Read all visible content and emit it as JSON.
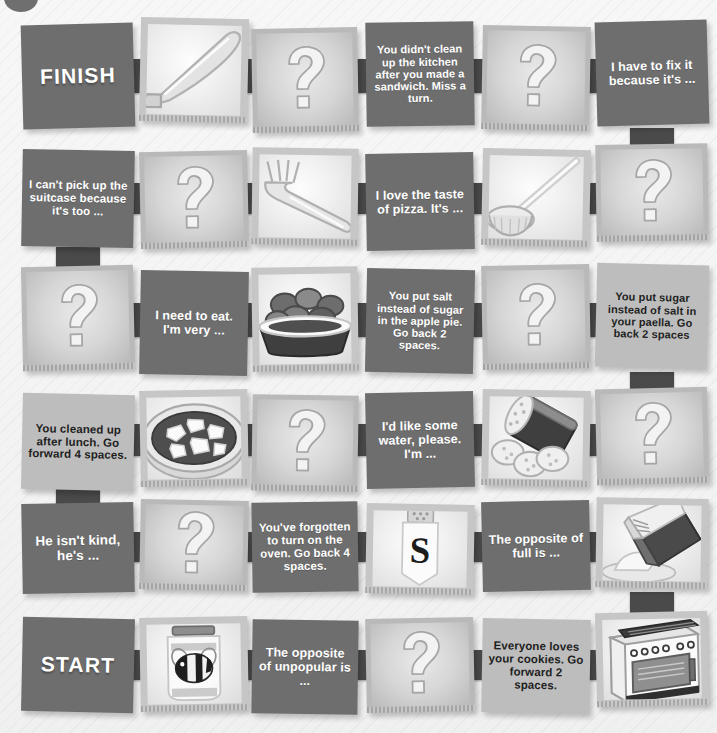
{
  "board": {
    "title_mark": "page-corner-circle",
    "start_label": "START",
    "finish_label": "FINISH",
    "colors": {
      "dark_tile": "#6e6e6e",
      "light_tile": "#bdbdbd",
      "picture_mat": "#c6c6c6",
      "strap": "#4a4a4a",
      "page_background": "#f2f2f2",
      "dark_text": "#ffffff",
      "light_text": "#2b2b2b"
    },
    "rows": [
      {
        "index": 1,
        "tiles": [
          {
            "kind": "dark",
            "name": "tile-finish",
            "text": "FINISH",
            "style": "big"
          },
          {
            "kind": "picture",
            "name": "tile-picture-knife",
            "icon": "knife-icon",
            "text": ""
          },
          {
            "kind": "question",
            "name": "tile-question-r1",
            "icon": "question-mark-icon",
            "text": ""
          },
          {
            "kind": "dark",
            "name": "tile-miss-a-turn-kitchen",
            "text": "You didn't clean up the kitchen after you made a sandwich. Miss a turn."
          },
          {
            "kind": "question",
            "name": "tile-question-r1b",
            "icon": "question-mark-icon",
            "text": ""
          },
          {
            "kind": "dark",
            "name": "tile-prompt-fix-it",
            "text": "I have to fix it because it's ..."
          }
        ]
      },
      {
        "index": 2,
        "tiles": [
          {
            "kind": "dark",
            "name": "tile-prompt-suitcase",
            "text": "I can't pick up the suitcase because it's too ..."
          },
          {
            "kind": "question",
            "name": "tile-question-r2",
            "icon": "question-mark-icon",
            "text": ""
          },
          {
            "kind": "picture",
            "name": "tile-picture-fork",
            "icon": "fork-icon",
            "text": ""
          },
          {
            "kind": "dark",
            "name": "tile-prompt-pizza",
            "text": "I love the taste of pizza. It's ..."
          },
          {
            "kind": "picture",
            "name": "tile-picture-ladle",
            "icon": "ladle-icon",
            "text": ""
          },
          {
            "kind": "question",
            "name": "tile-question-r2b",
            "icon": "question-mark-icon",
            "text": ""
          }
        ]
      },
      {
        "index": 3,
        "tiles": [
          {
            "kind": "question",
            "name": "tile-question-r3",
            "icon": "question-mark-icon",
            "text": ""
          },
          {
            "kind": "dark",
            "name": "tile-prompt-need-to-eat",
            "text": "I need to eat. I'm very ..."
          },
          {
            "kind": "picture",
            "name": "tile-picture-bowl-of-fruit",
            "icon": "bowl-of-fruit-icon",
            "text": ""
          },
          {
            "kind": "dark",
            "name": "tile-go-back-apple-pie",
            "text": "You put salt instead of sugar in the apple pie. Go back 2 spaces."
          },
          {
            "kind": "question",
            "name": "tile-question-r3b",
            "icon": "question-mark-icon",
            "text": ""
          },
          {
            "kind": "light",
            "name": "tile-go-back-paella",
            "text": "You put sugar instead of salt in your paella. Go back 2 spaces"
          }
        ]
      },
      {
        "index": 4,
        "tiles": [
          {
            "kind": "light",
            "name": "tile-go-forward-cleaned-up",
            "text": "You cleaned up after lunch. Go forward 4 spaces."
          },
          {
            "kind": "picture",
            "name": "tile-picture-pizza",
            "icon": "pizza-icon",
            "text": ""
          },
          {
            "kind": "question",
            "name": "tile-question-r4",
            "icon": "question-mark-icon",
            "text": ""
          },
          {
            "kind": "dark",
            "name": "tile-prompt-water",
            "text": "I'd like some water, please. I'm ..."
          },
          {
            "kind": "picture",
            "name": "tile-picture-biscuit-tin",
            "icon": "biscuit-tin-icon",
            "text": ""
          },
          {
            "kind": "question",
            "name": "tile-question-r4b",
            "icon": "question-mark-icon",
            "text": ""
          }
        ]
      },
      {
        "index": 5,
        "tiles": [
          {
            "kind": "dark",
            "name": "tile-prompt-isnt-kind",
            "text": "He isn't kind, he's ..."
          },
          {
            "kind": "question",
            "name": "tile-question-r5",
            "icon": "question-mark-icon",
            "text": ""
          },
          {
            "kind": "dark",
            "name": "tile-go-back-oven",
            "text": "You've forgotten to turn on the oven. Go back 4 spaces."
          },
          {
            "kind": "picture",
            "name": "tile-picture-salt-shaker",
            "icon": "salt-shaker-icon",
            "text": "S"
          },
          {
            "kind": "dark",
            "name": "tile-prompt-opposite-full",
            "text": "The opposite of full is ..."
          },
          {
            "kind": "picture",
            "name": "tile-picture-flour-bag",
            "icon": "flour-bag-icon",
            "text": ""
          }
        ]
      },
      {
        "index": 6,
        "tiles": [
          {
            "kind": "dark",
            "name": "tile-start",
            "text": "START",
            "style": "big"
          },
          {
            "kind": "picture",
            "name": "tile-picture-honey-jar",
            "icon": "honey-jar-bee-icon",
            "text": ""
          },
          {
            "kind": "dark",
            "name": "tile-prompt-opposite-unpopular",
            "text": "The opposite of unpopular is ..."
          },
          {
            "kind": "question",
            "name": "tile-question-r6",
            "icon": "question-mark-icon",
            "text": ""
          },
          {
            "kind": "light",
            "name": "tile-go-forward-cookies",
            "text": "Everyone loves your cookies. Go forward 2 spaces."
          },
          {
            "kind": "picture",
            "name": "tile-picture-oven",
            "icon": "oven-icon",
            "text": ""
          }
        ]
      }
    ]
  }
}
